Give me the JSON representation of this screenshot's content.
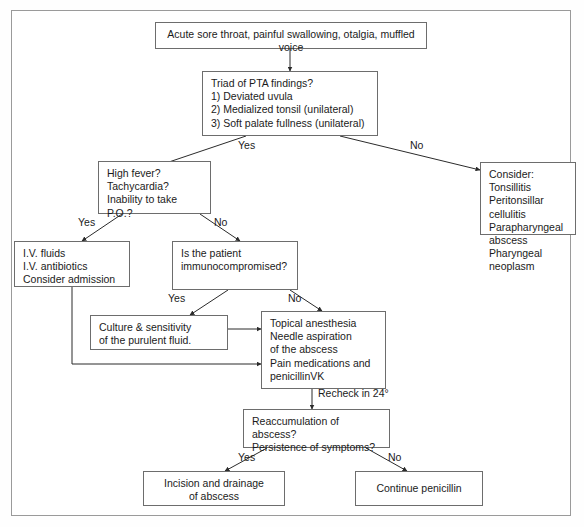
{
  "diagram": {
    "frame_color": "#9a9a9a",
    "box_border_color": "#6d6d6d",
    "line_color": "#2b2b2b",
    "background": "#ffffff",
    "nodes": {
      "presentation": "Acute sore throat, painful swallowing, otalgia, muffled voice",
      "triad": "Triad of PTA findings?\n1) Deviated uvula\n2) Medialized tonsil (unilateral)\n3) Soft palate fullness (unilateral)",
      "consider": "Consider:\nTonsillitis\nPeritonsillar cellulitis\nParapharyngeal abscess\nPharyngeal neoplasm",
      "severity": "High fever?\nTachycardia?\nInability to take P.O.?",
      "iv_support": "I.V. fluids\nI.V. antibiotics\nConsider admission",
      "immuno": "Is the patient\nimmunocompromised?",
      "culture": "Culture & sensitivity\nof the purulent fluid.",
      "drainage": "Topical anesthesia\nNeedle aspiration\n  of the abscess\nPain medications and\n  penicillinVK",
      "recheck": "Reaccumulation of abscess?\nPersistence of symptoms?",
      "incision": "Incision and drainage\nof abscess",
      "continue_pcn": "Continue penicillin"
    },
    "edge_labels": {
      "triad_yes": "Yes",
      "triad_no": "No",
      "severity_yes": "Yes",
      "severity_no": "No",
      "immuno_yes": "Yes",
      "immuno_no": "No",
      "recheck_interval": "Recheck in 24°",
      "final_yes": "Yes",
      "final_no": "No"
    }
  }
}
